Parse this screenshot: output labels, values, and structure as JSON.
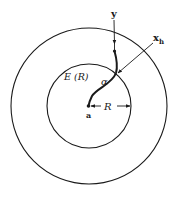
{
  "diagram": {
    "labels": {
      "y": "y",
      "x_base": "x",
      "x_sub": "h",
      "region": "E (R)",
      "alpha": "α",
      "radius": "R",
      "center": "a"
    },
    "colors": {
      "stroke": "#1a1a1a",
      "background": "#ffffff"
    }
  }
}
